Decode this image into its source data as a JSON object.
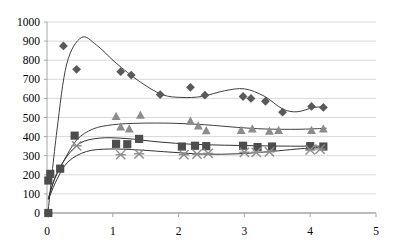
{
  "chart_data": {
    "type": "scatter",
    "title": "",
    "subtitle": "",
    "xlabel": "",
    "ylabel": "",
    "xlim": [
      0,
      5
    ],
    "ylim": [
      0,
      1000
    ],
    "xticks": [
      0,
      1,
      2,
      3,
      4,
      5
    ],
    "yticks": [
      0,
      100,
      200,
      300,
      400,
      500,
      600,
      700,
      800,
      900,
      1000
    ],
    "xtick_labels": [
      "0",
      "1",
      "2",
      "3",
      "4",
      "5"
    ],
    "ytick_labels": [
      "0",
      "100",
      "200",
      "300",
      "400",
      "500",
      "600",
      "700",
      "800",
      "900",
      "1000"
    ],
    "grid": "horizontal",
    "grid_color": "#d9d9d9",
    "axis_color": "#a6a6a6",
    "legend": "none",
    "legend_position": "none",
    "plot_area": {
      "left": 47,
      "right": 376,
      "top": 22,
      "bottom": 213
    },
    "series": [
      {
        "name": "Series 1",
        "marker": "diamond",
        "color": "#595959",
        "line_color": "#404040",
        "trend": "smooth",
        "points": [
          {
            "x": 0.02,
            "y": 0
          },
          {
            "x": 0.25,
            "y": 875
          },
          {
            "x": 0.45,
            "y": 752
          },
          {
            "x": 1.12,
            "y": 740
          },
          {
            "x": 1.28,
            "y": 722
          },
          {
            "x": 1.72,
            "y": 620
          },
          {
            "x": 2.18,
            "y": 658
          },
          {
            "x": 2.4,
            "y": 617
          },
          {
            "x": 2.98,
            "y": 610
          },
          {
            "x": 3.1,
            "y": 600
          },
          {
            "x": 3.32,
            "y": 585
          },
          {
            "x": 3.58,
            "y": 528
          },
          {
            "x": 4.02,
            "y": 558
          },
          {
            "x": 4.2,
            "y": 553
          }
        ],
        "curve": [
          {
            "x": 0.02,
            "y": 20
          },
          {
            "x": 0.15,
            "y": 430
          },
          {
            "x": 0.3,
            "y": 780
          },
          {
            "x": 0.52,
            "y": 918
          },
          {
            "x": 0.75,
            "y": 880
          },
          {
            "x": 1.05,
            "y": 785
          },
          {
            "x": 1.4,
            "y": 690
          },
          {
            "x": 1.75,
            "y": 620
          },
          {
            "x": 2.05,
            "y": 605
          },
          {
            "x": 2.35,
            "y": 610
          },
          {
            "x": 2.7,
            "y": 640
          },
          {
            "x": 3.0,
            "y": 650
          },
          {
            "x": 3.3,
            "y": 612
          },
          {
            "x": 3.58,
            "y": 545
          },
          {
            "x": 3.8,
            "y": 530
          },
          {
            "x": 4.05,
            "y": 552
          },
          {
            "x": 4.22,
            "y": 556
          }
        ]
      },
      {
        "name": "Series 2",
        "marker": "triangle",
        "color": "#8c8c8c",
        "line_color": "#404040",
        "trend": "smooth",
        "points": [
          {
            "x": 1.05,
            "y": 505
          },
          {
            "x": 1.12,
            "y": 450
          },
          {
            "x": 1.25,
            "y": 440
          },
          {
            "x": 1.42,
            "y": 512
          },
          {
            "x": 2.18,
            "y": 480
          },
          {
            "x": 2.3,
            "y": 455
          },
          {
            "x": 2.42,
            "y": 430
          },
          {
            "x": 2.95,
            "y": 432
          },
          {
            "x": 3.12,
            "y": 440
          },
          {
            "x": 3.38,
            "y": 428
          },
          {
            "x": 3.52,
            "y": 432
          },
          {
            "x": 4.02,
            "y": 432
          },
          {
            "x": 4.2,
            "y": 440
          }
        ],
        "curve": [
          {
            "x": 0.02,
            "y": 75
          },
          {
            "x": 0.12,
            "y": 185
          },
          {
            "x": 0.25,
            "y": 270
          },
          {
            "x": 0.45,
            "y": 382
          },
          {
            "x": 0.7,
            "y": 440
          },
          {
            "x": 1.0,
            "y": 462
          },
          {
            "x": 1.4,
            "y": 470
          },
          {
            "x": 1.9,
            "y": 470
          },
          {
            "x": 2.4,
            "y": 462
          },
          {
            "x": 2.9,
            "y": 448
          },
          {
            "x": 3.3,
            "y": 440
          },
          {
            "x": 3.7,
            "y": 438
          },
          {
            "x": 4.0,
            "y": 440
          },
          {
            "x": 4.25,
            "y": 444
          }
        ]
      },
      {
        "name": "Series 3",
        "marker": "square",
        "color": "#4d4d4d",
        "line_color": "#333333",
        "trend": "smooth",
        "points": [
          {
            "x": 0.02,
            "y": 0
          },
          {
            "x": 0.02,
            "y": 170
          },
          {
            "x": 0.05,
            "y": 205
          },
          {
            "x": 0.2,
            "y": 232
          },
          {
            "x": 0.42,
            "y": 405
          },
          {
            "x": 1.05,
            "y": 362
          },
          {
            "x": 1.22,
            "y": 360
          },
          {
            "x": 1.4,
            "y": 388
          },
          {
            "x": 2.05,
            "y": 348
          },
          {
            "x": 2.25,
            "y": 352
          },
          {
            "x": 2.42,
            "y": 350
          },
          {
            "x": 2.98,
            "y": 352
          },
          {
            "x": 3.2,
            "y": 345
          },
          {
            "x": 3.42,
            "y": 348
          },
          {
            "x": 4.0,
            "y": 350
          },
          {
            "x": 4.2,
            "y": 348
          }
        ],
        "curve": [
          {
            "x": 0.02,
            "y": 75
          },
          {
            "x": 0.12,
            "y": 180
          },
          {
            "x": 0.28,
            "y": 285
          },
          {
            "x": 0.5,
            "y": 365
          },
          {
            "x": 0.8,
            "y": 392
          },
          {
            "x": 1.2,
            "y": 390
          },
          {
            "x": 1.7,
            "y": 372
          },
          {
            "x": 2.2,
            "y": 360
          },
          {
            "x": 2.7,
            "y": 355
          },
          {
            "x": 3.2,
            "y": 352
          },
          {
            "x": 3.7,
            "y": 350
          },
          {
            "x": 4.25,
            "y": 350
          }
        ]
      },
      {
        "name": "Series 4",
        "marker": "cross",
        "color": "#8c8c8c",
        "line_color": "#333333",
        "trend": "smooth",
        "points": [
          {
            "x": 0.45,
            "y": 352
          },
          {
            "x": 1.12,
            "y": 305
          },
          {
            "x": 1.4,
            "y": 310
          },
          {
            "x": 2.08,
            "y": 305
          },
          {
            "x": 2.28,
            "y": 308
          },
          {
            "x": 2.45,
            "y": 312
          },
          {
            "x": 3.0,
            "y": 318
          },
          {
            "x": 3.18,
            "y": 318
          },
          {
            "x": 3.38,
            "y": 320
          },
          {
            "x": 4.0,
            "y": 330
          },
          {
            "x": 4.15,
            "y": 335
          }
        ],
        "curve": [
          {
            "x": 0.02,
            "y": 70
          },
          {
            "x": 0.15,
            "y": 175
          },
          {
            "x": 0.32,
            "y": 268
          },
          {
            "x": 0.6,
            "y": 322
          },
          {
            "x": 0.95,
            "y": 335
          },
          {
            "x": 1.4,
            "y": 330
          },
          {
            "x": 1.9,
            "y": 318
          },
          {
            "x": 2.4,
            "y": 308
          },
          {
            "x": 2.9,
            "y": 310
          },
          {
            "x": 3.4,
            "y": 322
          },
          {
            "x": 3.8,
            "y": 335
          },
          {
            "x": 4.2,
            "y": 345
          }
        ]
      }
    ]
  }
}
